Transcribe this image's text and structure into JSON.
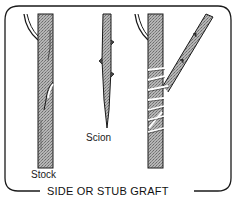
{
  "figure": {
    "caption": "SIDE OR STUB GRAFT",
    "labels": {
      "stock": "Stock",
      "scion": "Scion"
    },
    "parts": [
      {
        "name": "stock",
        "description": "rootstock trunk with side cut"
      },
      {
        "name": "scion",
        "description": "wedge-cut scion twig with buds"
      },
      {
        "name": "grafted-trunk",
        "description": "stock with scion inserted and wrapped"
      }
    ],
    "colors": {
      "line": "#1a1a1a",
      "bark_fill": "#9a9a9a",
      "background": "#ffffff",
      "wrap": "#ffffff"
    }
  }
}
